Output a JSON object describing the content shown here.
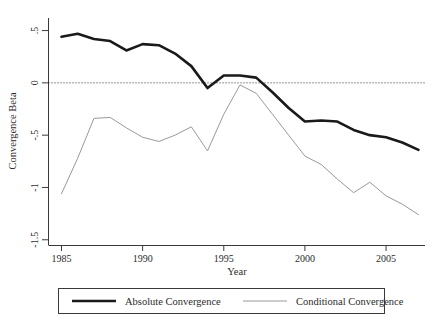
{
  "chart_data": {
    "type": "line",
    "title": "",
    "xlabel": "Year",
    "ylabel": "Convergence Beta",
    "xlim": [
      1984.2,
      2007.4
    ],
    "ylim": [
      -1.55,
      0.62
    ],
    "xticks": [
      1985,
      1990,
      1995,
      2000,
      2005
    ],
    "xtick_labels": [
      "1985",
      "1990",
      "1995",
      "2000",
      "2005"
    ],
    "yticks": [
      0.5,
      0,
      -0.5,
      -1,
      -1.5
    ],
    "ytick_labels": [
      ".5",
      "0",
      "-.5",
      "-1",
      "-1.5"
    ],
    "grid": false,
    "zero_reference_line": 0,
    "zero_line_style": "dotted",
    "legend_position": "bottom-outside",
    "x": [
      1985,
      1986,
      1987,
      1988,
      1989,
      1990,
      1991,
      1992,
      1993,
      1994,
      1995,
      1996,
      1997,
      1998,
      1999,
      2000,
      2001,
      2002,
      2003,
      2004,
      2005,
      2006,
      2007
    ],
    "series": [
      {
        "name": "Absolute Convergence",
        "color": "#1a1a1a",
        "width": 2.6,
        "values": [
          0.44,
          0.47,
          0.42,
          0.4,
          0.31,
          0.37,
          0.36,
          0.28,
          0.16,
          -0.05,
          0.07,
          0.07,
          0.05,
          -0.09,
          -0.24,
          -0.37,
          -0.36,
          -0.37,
          -0.45,
          -0.5,
          -0.52,
          -0.57,
          -0.64
        ]
      },
      {
        "name": "Conditional Convergence",
        "color": "#999999",
        "width": 1.0,
        "values": [
          -1.06,
          -0.72,
          -0.34,
          -0.33,
          -0.43,
          -0.52,
          -0.56,
          -0.5,
          -0.42,
          -0.65,
          -0.3,
          -0.02,
          -0.1,
          -0.3,
          -0.5,
          -0.7,
          -0.78,
          -0.92,
          -1.05,
          -0.95,
          -1.08,
          -1.16,
          -1.26
        ]
      }
    ]
  },
  "legend": {
    "entries": [
      {
        "label": "Absolute Convergence",
        "swatch": "thick-black-line"
      },
      {
        "label": "Conditional Convergence",
        "swatch": "thin-gray-line"
      }
    ]
  },
  "colors": {
    "absolute": "#1a1a1a",
    "conditional": "#999999",
    "axis": "#3a3a3a",
    "background": "#ffffff",
    "text": "#2b2b2b"
  }
}
